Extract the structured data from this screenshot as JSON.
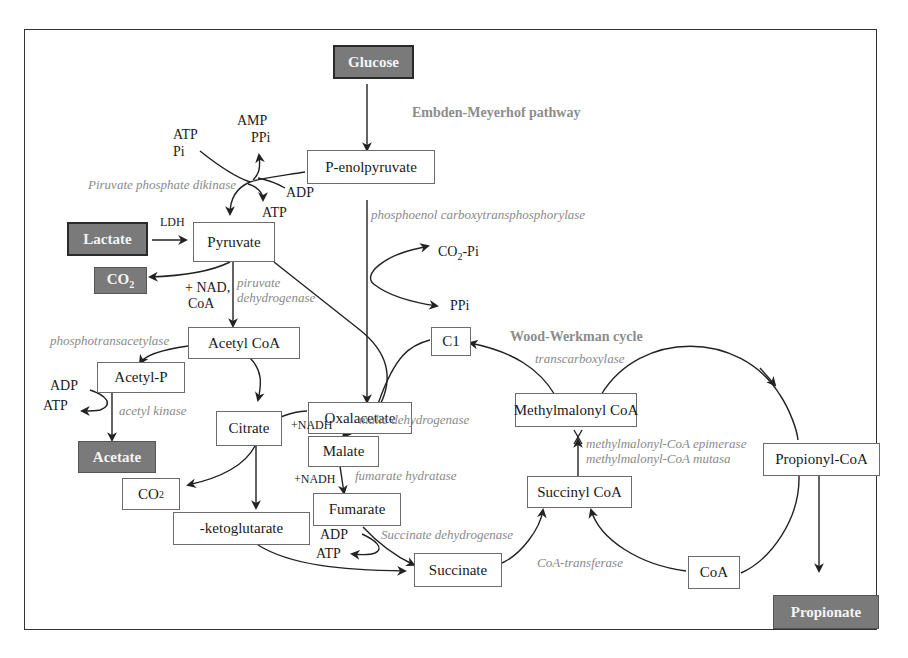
{
  "diagram": {
    "title_pathways": {
      "embden": "Embden-Meyerhof pathway",
      "wood_werkman": "Wood-Werkman cycle"
    },
    "nodes": {
      "glucose": "Glucose",
      "penolpyruvate": "P-enolpyruvate",
      "lactate": "Lactate",
      "pyruvate": "Pyruvate",
      "co2_top": "CO2",
      "acetyl_coa": "Acetyl CoA",
      "acetyl_p": "Acetyl-P",
      "acetate": "Acetate",
      "citrate": "Citrate",
      "co2_bottom": "CO2",
      "ketoglutarate": "-ketoglutarate",
      "oxalacetate": "Oxalacetate",
      "malate": "Malate",
      "fumarate": "Fumarate",
      "succinate": "Succinate",
      "c1": "C1",
      "methylmalonyl_coa": "Methylmalonyl CoA",
      "succinyl_coa": "Succinyl CoA",
      "propionyl_coa": "Propionyl-CoA",
      "coa": "CoA",
      "propionate": "Propionate"
    },
    "cofactors": {
      "atp_pi_top": "ATP",
      "pi_top": "Pi",
      "amp": "AMP",
      "ppi_top": "PPi",
      "adp_top": "ADP",
      "atp_top2": "ATP",
      "ldh": "LDH",
      "nad": "+ NAD,",
      "coa_cof": "CoA",
      "co2_pi": "CO2-Pi",
      "ppi_mid": "PPi",
      "adp_left": "ADP",
      "atp_left": "ATP",
      "nadh1": "+NADH",
      "nadh2": "+NADH",
      "adp_bottom": "ADP",
      "atp_bottom": "ATP"
    },
    "enzymes": {
      "ppdk": "Piruvate phosphate dikinase",
      "pepctp": "phosphoenol carboxytransphosphorylase",
      "pdh_1": "piruvate",
      "pdh_2": "dehydrogenase",
      "pta": "phosphotransacetylase",
      "ack": "acetyl kinase",
      "mdh": "malic dehydrogenase",
      "fh": "fumarate hydratase",
      "sdh": "Succinate dehydrogenase",
      "transcarboxylase": "transcarboxylase",
      "mce": "methylmalonyl-CoA epimerase",
      "mcm": "methylmalonyl-CoA mutasa",
      "coa_transferase": "CoA-transferase"
    },
    "colors": {
      "substrate_fill": "#7a7a7a",
      "enzyme_text": "#8a8a8a",
      "line": "#222222"
    }
  }
}
